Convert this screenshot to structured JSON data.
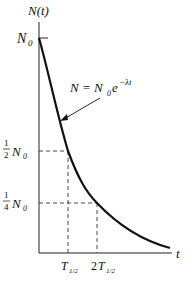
{
  "figure": {
    "y_axis_label": "N(t)",
    "x_axis_label": "t",
    "y_ticks": [
      {
        "label": "N",
        "sub": "0",
        "frac": "",
        "value": 1.0
      },
      {
        "label": "N",
        "sub": "0",
        "frac": "1/2",
        "value": 0.5
      },
      {
        "label": "N",
        "sub": "0",
        "frac": "1/4",
        "value": 0.25
      }
    ],
    "x_ticks": [
      {
        "label": "T",
        "sub": "1/2",
        "prefix": ""
      },
      {
        "label": "T",
        "sub": "1/2",
        "prefix": "2"
      }
    ],
    "equation": {
      "lhs": "N = N",
      "sub": "0",
      "base": "e",
      "exp": "−λt"
    },
    "colors": {
      "curve": "#111111",
      "axes": "#222222",
      "dashes": "#333333"
    }
  }
}
